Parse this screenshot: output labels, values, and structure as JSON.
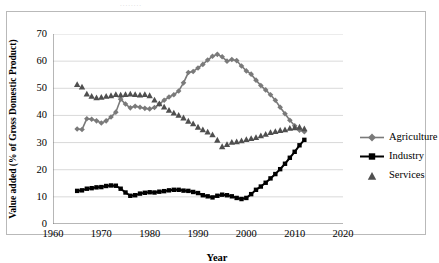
{
  "top_bleed_text": "........",
  "chart_data": {
    "type": "line",
    "title": "",
    "xlabel": "Year",
    "ylabel": "Value added (% of Gross Domestic Product)",
    "xlim": [
      1960,
      2020
    ],
    "ylim": [
      0,
      70
    ],
    "xticks": [
      1960,
      1970,
      1980,
      1990,
      2000,
      2010,
      2020
    ],
    "yticks": [
      0,
      10,
      20,
      30,
      40,
      50,
      60,
      70
    ],
    "grid": "horizontal",
    "legend_position": "right",
    "x": [
      1965,
      1966,
      1967,
      1968,
      1969,
      1970,
      1971,
      1972,
      1973,
      1974,
      1975,
      1976,
      1977,
      1978,
      1979,
      1980,
      1981,
      1982,
      1983,
      1984,
      1985,
      1986,
      1987,
      1988,
      1989,
      1990,
      1991,
      1992,
      1993,
      1994,
      1995,
      1996,
      1997,
      1998,
      1999,
      2000,
      2001,
      2002,
      2003,
      2004,
      2005,
      2006,
      2007,
      2008,
      2009,
      2010,
      2011,
      2012
    ],
    "series": [
      {
        "name": "Agriculture",
        "color": "#7a7a7a",
        "marker": "diamond",
        "values": [
          35.0,
          34.8,
          38.8,
          38.6,
          38.0,
          37.2,
          38.0,
          39.4,
          41.2,
          46.0,
          44.2,
          42.8,
          43.4,
          43.0,
          42.6,
          42.4,
          42.9,
          44.2,
          45.6,
          46.8,
          47.6,
          49.0,
          52.0,
          55.8,
          56.2,
          57.5,
          58.8,
          60.4,
          61.8,
          62.5,
          61.6,
          60.0,
          60.6,
          60.2,
          58.2,
          56.4,
          55.2,
          53.0,
          51.0,
          49.4,
          47.6,
          45.6,
          43.0,
          40.6,
          38.2,
          36.2,
          34.6,
          34.0
        ]
      },
      {
        "name": "Industry",
        "color": "#000000",
        "marker": "square",
        "values": [
          12.2,
          12.4,
          13.0,
          13.2,
          13.5,
          13.6,
          14.0,
          14.2,
          14.1,
          13.0,
          11.6,
          10.4,
          10.6,
          11.2,
          11.5,
          11.7,
          11.6,
          11.9,
          12.1,
          12.4,
          12.6,
          12.6,
          12.3,
          12.2,
          11.8,
          11.4,
          10.6,
          10.2,
          9.8,
          10.4,
          10.8,
          10.6,
          10.2,
          9.6,
          9.2,
          9.6,
          11.0,
          12.6,
          13.8,
          15.2,
          16.8,
          18.4,
          20.2,
          22.2,
          24.4,
          26.6,
          29.0,
          31.0
        ]
      },
      {
        "name": "Services",
        "color": "#4f4f4f",
        "marker": "triangle",
        "values": [
          51.5,
          50.6,
          48.0,
          47.2,
          46.6,
          46.8,
          47.2,
          47.4,
          47.8,
          47.6,
          47.8,
          48.0,
          47.8,
          47.6,
          47.8,
          47.4,
          45.8,
          44.4,
          43.2,
          42.0,
          41.0,
          40.2,
          39.2,
          38.0,
          37.0,
          35.8,
          34.8,
          34.0,
          33.0,
          31.0,
          28.6,
          29.4,
          30.2,
          30.4,
          30.8,
          31.2,
          31.6,
          32.0,
          32.6,
          33.2,
          33.8,
          34.2,
          34.6,
          34.8,
          35.4,
          35.6,
          35.8,
          35.2
        ]
      }
    ]
  },
  "legend": {
    "items": [
      {
        "label": "Agriculture"
      },
      {
        "label": "Industry"
      },
      {
        "label": "Services"
      }
    ]
  }
}
